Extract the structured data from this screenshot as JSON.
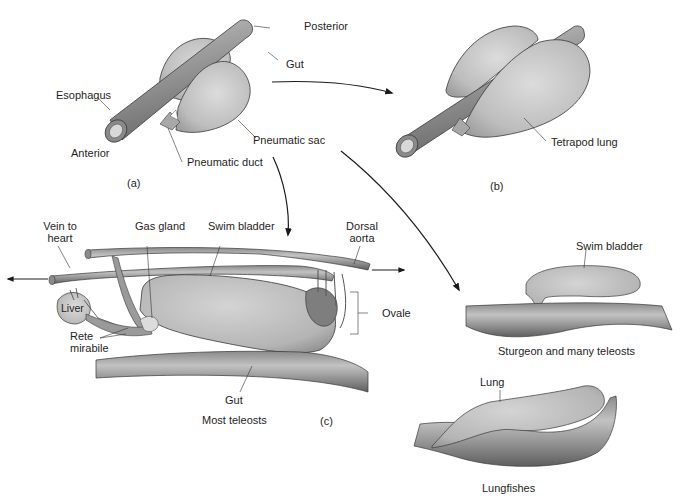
{
  "figure": {
    "panels": {
      "a": {
        "tag": "(a)",
        "labels": {
          "posterior": "Posterior",
          "gut": "Gut",
          "esophagus": "Esophagus",
          "anterior": "Anterior",
          "pneumatic_sac": "Pneumatic sac",
          "pneumatic_duct": "Pneumatic duct"
        }
      },
      "b": {
        "tag": "(b)",
        "labels": {
          "tetrapod_lung": "Tetrapod lung"
        }
      },
      "c": {
        "tag": "(c)",
        "caption": "Most teleosts",
        "labels": {
          "vein_to_heart_1": "Vein to",
          "vein_to_heart_2": "heart",
          "gas_gland": "Gas gland",
          "swim_bladder": "Swim bladder",
          "dorsal_aorta_1": "Dorsal",
          "dorsal_aorta_2": "aorta",
          "liver": "Liver",
          "rete_mirabile_1": "Rete",
          "rete_mirabile_2": "mirabile",
          "ovale": "Ovale",
          "gut": "Gut"
        }
      },
      "sturgeon": {
        "caption": "Sturgeon and many teleosts",
        "labels": {
          "swim_bladder": "Swim bladder"
        }
      },
      "lungfish": {
        "caption": "Lungfishes",
        "labels": {
          "lung": "Lung"
        }
      }
    },
    "colors": {
      "tube_dark": "#6e6e6e",
      "tube_mid": "#9a9a9a",
      "tube_light": "#c4c4c4",
      "sac_fill": "#bdbdbd",
      "sac_light": "#d6d6d6",
      "outline": "#3a3a3a",
      "arrow": "#1a1a1a",
      "text": "#1e1e1e"
    }
  }
}
